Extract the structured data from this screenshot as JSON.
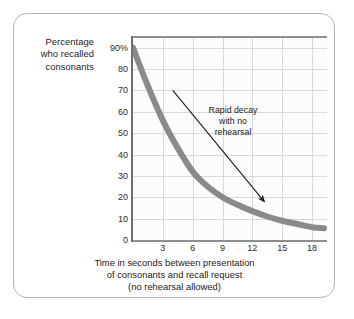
{
  "figure": {
    "frame_color": "#b5b5b5",
    "background": "#ffffff"
  },
  "y_axis": {
    "title_lines": [
      "Percentage",
      "who recalled",
      "consonants"
    ],
    "title_line_1": "Percentage",
    "title_line_2": "who recalled",
    "title_line_3": "consonants",
    "ticks": [
      "90%",
      "80",
      "70",
      "60",
      "50",
      "40",
      "30",
      "20",
      "10",
      "0"
    ],
    "tick_values": [
      90,
      80,
      70,
      60,
      50,
      40,
      30,
      20,
      10,
      0
    ]
  },
  "x_axis": {
    "ticks": [
      "3",
      "6",
      "9",
      "12",
      "15",
      "18"
    ],
    "tick_values": [
      3,
      6,
      9,
      12,
      15,
      18
    ],
    "caption_line_1": "Time in seconds between presentation",
    "caption_line_2": "of consonants and recall request",
    "caption_line_3": "(no rehearsal allowed)"
  },
  "annotation": {
    "line_1": "Rapid decay",
    "line_2": "with no",
    "line_3": "rehearsal",
    "arrow_color": "#1b1b1b"
  },
  "chart_data": {
    "type": "line",
    "title": "",
    "xlabel": "Time in seconds between presentation of consonants and recall request (no rehearsal allowed)",
    "ylabel": "Percentage who recalled consonants",
    "xlim": [
      0,
      19.5
    ],
    "ylim": [
      0,
      95
    ],
    "xticks": [
      3,
      6,
      9,
      12,
      15,
      18
    ],
    "yticks": [
      0,
      10,
      20,
      30,
      40,
      50,
      60,
      70,
      80,
      90
    ],
    "ytick_labels": [
      "0",
      "10",
      "20",
      "30",
      "40",
      "50",
      "60",
      "70",
      "80",
      "90%"
    ],
    "grid": true,
    "legend": "none",
    "line_color": "#8a8a8a",
    "line_width": 6,
    "series": [
      {
        "name": "Percentage who recalled consonants",
        "x": [
          0,
          1.5,
          3,
          4.5,
          6,
          7.5,
          9,
          10.5,
          12,
          13.5,
          15,
          16.5,
          18,
          19.2
        ],
        "values": [
          90,
          72,
          56,
          43,
          32,
          25,
          20,
          16.5,
          13.5,
          11,
          9,
          7.5,
          6,
          5.5
        ]
      }
    ],
    "annotations": [
      {
        "text": "Rapid decay with no rehearsal",
        "type": "arrow",
        "arrow_from_x": 4.0,
        "arrow_from_y": 70,
        "arrow_to_x": 13.2,
        "arrow_to_y": 18
      }
    ]
  }
}
